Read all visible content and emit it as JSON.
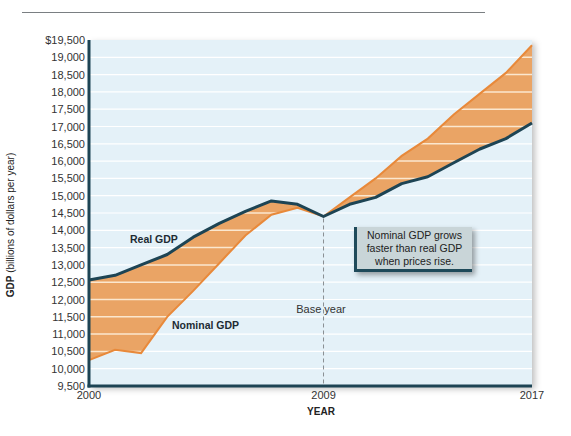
{
  "chart_data": {
    "type": "area",
    "title": "",
    "xlabel": "YEAR",
    "ylabel": "GDP (billions of dollars per year)",
    "ylabel_bold": "GDP",
    "ylabel_rest": " (billions of dollars per year)",
    "ylim": [
      9500,
      19500
    ],
    "xlim": [
      2000,
      2017
    ],
    "grid": true,
    "x_tick_labels": [
      "2000",
      "2009",
      "2017"
    ],
    "x_ticks": [
      2000,
      2009,
      2017
    ],
    "y_ticks": [
      9500,
      10000,
      10500,
      11000,
      11500,
      12000,
      12500,
      13000,
      13500,
      14000,
      14500,
      15000,
      15500,
      16000,
      16500,
      17000,
      17500,
      18000,
      18500,
      19000,
      19500
    ],
    "y_tick_labels": [
      "9,500",
      "10,000",
      "10,500",
      "11,000",
      "11,500",
      "12,000",
      "12,500",
      "13,000",
      "13,500",
      "14,000",
      "14,500",
      "15,000",
      "15,500",
      "16,000",
      "16,500",
      "17,000",
      "17,500",
      "18,000",
      "18,500",
      "19,000",
      "$19,500"
    ],
    "x": [
      2000,
      2001,
      2002,
      2003,
      2004,
      2005,
      2006,
      2007,
      2008,
      2009,
      2010,
      2011,
      2012,
      2013,
      2014,
      2015,
      2016,
      2017
    ],
    "series": [
      {
        "name": "Real GDP",
        "color": "#1d4454",
        "values": [
          12560,
          12700,
          13000,
          13300,
          13800,
          14200,
          14550,
          14850,
          14750,
          14400,
          14750,
          14950,
          15350,
          15550,
          15950,
          16350,
          16650,
          17100
        ]
      },
      {
        "name": "Nominal GDP",
        "color": "#e8893a",
        "values": [
          10250,
          10550,
          10450,
          11500,
          12250,
          13050,
          13850,
          14450,
          14650,
          14400,
          14950,
          15500,
          16150,
          16650,
          17350,
          17950,
          18550,
          19350
        ]
      }
    ],
    "annotations": [
      {
        "text": "Base year",
        "x": 2009,
        "style": "dashed-vertical-line"
      },
      {
        "text": "Nominal GDP grows faster than real GDP when prices rise.",
        "type": "callout"
      }
    ],
    "fill_between": {
      "color": "#eaa465",
      "stripe_color": "#fbe7cf"
    },
    "plot_background": "#e4f1f8",
    "axis_color": "#1d4454"
  },
  "labels": {
    "real_gdp": "Real GDP",
    "nominal_gdp": "Nominal GDP",
    "base_year": "Base year",
    "callout": "Nominal GDP grows faster than real GDP when prices rise."
  }
}
